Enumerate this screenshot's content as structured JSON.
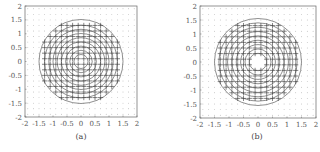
{
  "chart_data": [
    {
      "type": "quiver",
      "caption": "(a)",
      "title": "",
      "xlabel": "",
      "ylabel": "",
      "xlim": [
        -2,
        2
      ],
      "ylim": [
        -2,
        2
      ],
      "xticks": [
        "-2",
        "-1.5",
        "-1",
        "-0.5",
        "0",
        "0.5",
        "1",
        "1.5",
        "2"
      ],
      "yticks": [
        "2",
        "1.5",
        "1",
        "0.5",
        "0",
        "-0.5",
        "-1",
        "-1.5",
        "-2"
      ],
      "grid": false,
      "description": "Vector field on grid with concentric circles; arrows converge toward center",
      "circle_radii": [
        0.25,
        0.4,
        0.55,
        0.7,
        0.85,
        1.0,
        1.15,
        1.3,
        1.5
      ],
      "inner_hole_radius": 0
    },
    {
      "type": "quiver",
      "caption": "(b)",
      "title": "",
      "xlabel": "",
      "ylabel": "",
      "xlim": [
        -2,
        2
      ],
      "ylim": [
        -2,
        2
      ],
      "xticks": [
        "-2",
        "-1.5",
        "-1",
        "-0.5",
        "0",
        "0.5",
        "1",
        "1.5",
        "2"
      ],
      "yticks": [
        "2",
        "1.5",
        "1",
        "0.5",
        "0",
        "-0.5",
        "-1",
        "-1.5",
        "-2"
      ],
      "grid": false,
      "description": "Vector field on grid with concentric circles; empty region near center",
      "circle_radii": [
        0.3,
        0.45,
        0.6,
        0.75,
        0.9,
        1.05,
        1.2,
        1.35,
        1.5
      ],
      "inner_hole_radius": 0.3
    }
  ]
}
